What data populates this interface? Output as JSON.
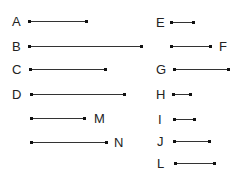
{
  "diagram": {
    "type": "line-segments",
    "colors": {
      "line": "#333333",
      "endpoint": "#111111",
      "text": "#222222",
      "background": "#ffffff"
    },
    "segments": [
      {
        "label": "A",
        "label_side": "left",
        "label_x": 12,
        "x1": 29,
        "x2": 86,
        "y": 21
      },
      {
        "label": "B",
        "label_side": "left",
        "label_x": 12,
        "x1": 29,
        "x2": 141,
        "y": 46
      },
      {
        "label": "C",
        "label_side": "left",
        "label_x": 12,
        "x1": 30,
        "x2": 105,
        "y": 69
      },
      {
        "label": "D",
        "label_side": "left",
        "label_x": 12,
        "x1": 31,
        "x2": 124,
        "y": 94
      },
      {
        "label": "M",
        "label_side": "right",
        "label_x": 94,
        "x1": 31,
        "x2": 84,
        "y": 118
      },
      {
        "label": "N",
        "label_side": "right",
        "label_x": 114,
        "x1": 31,
        "x2": 106,
        "y": 142
      },
      {
        "label": "E",
        "label_side": "left",
        "label_x": 156,
        "x1": 171,
        "x2": 193,
        "y": 22
      },
      {
        "label": "F",
        "label_side": "right",
        "label_x": 219,
        "x1": 171,
        "x2": 210,
        "y": 46
      },
      {
        "label": "G",
        "label_side": "left",
        "label_x": 156,
        "x1": 174,
        "x2": 228,
        "y": 69
      },
      {
        "label": "H",
        "label_side": "left",
        "label_x": 156,
        "x1": 173,
        "x2": 190,
        "y": 94
      },
      {
        "label": "I",
        "label_side": "left",
        "label_x": 158,
        "x1": 174,
        "x2": 194,
        "y": 119
      },
      {
        "label": "J",
        "label_side": "left",
        "label_x": 157,
        "x1": 174,
        "x2": 209,
        "y": 141
      },
      {
        "label": "L",
        "label_side": "left",
        "label_x": 157,
        "x1": 175,
        "x2": 214,
        "y": 163
      }
    ]
  }
}
